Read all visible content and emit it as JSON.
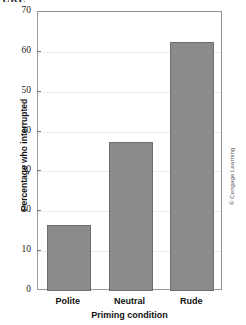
{
  "figure": {
    "clipped_caption": "URE",
    "credit": "© Cengage Learning"
  },
  "chart_data": {
    "type": "bar",
    "title": "",
    "categories": [
      "Polite",
      "Neutral",
      "Rude"
    ],
    "values": [
      16.5,
      37.5,
      62.5
    ],
    "series": [
      {
        "name": "Percentage who interrupted",
        "values": [
          16.5,
          37.5,
          62.5
        ]
      }
    ],
    "xlabel": "Priming condition",
    "ylabel": "Percentage who interrupted",
    "ylim": [
      0,
      70
    ],
    "yticks": [
      0,
      10,
      20,
      30,
      40,
      50,
      60,
      70
    ],
    "ytick_labels": [
      "0",
      "10",
      "20",
      "30",
      "40",
      "50",
      "60",
      "70"
    ],
    "grid": true,
    "legend": false,
    "bar_color": "#8b8b8b",
    "bar_edge_color": "#6f6f6f",
    "grid_color": "#ededed",
    "axis_color": "#9a9a9a"
  }
}
